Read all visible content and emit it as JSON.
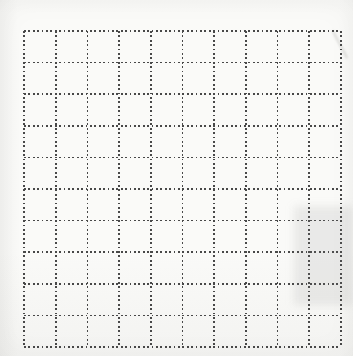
{
  "canvas": {
    "width_px": 353,
    "height_px": 356,
    "background_color": "#fafaf8"
  },
  "grid": {
    "rows": 10,
    "columns": 10,
    "left_px": 24,
    "top_px": 31,
    "right_px": 341,
    "bottom_px": 347,
    "line_style": "dotted",
    "dot_color": "#484848",
    "dot_size_px": 1.8,
    "dot_period_px": 4.4,
    "line_thickness_px": 1.8
  },
  "artifacts": {
    "shaded_patch": {
      "left_px": 294,
      "top_px": 206,
      "width_px": 59,
      "height_px": 99,
      "color": "rgba(125,125,120,0.13)",
      "blur_px": 4
    },
    "diagonal_smudge": {
      "center_x_px": 340,
      "center_y_px": 44,
      "length_px": 31,
      "width_px": 2,
      "rotation_deg": -28,
      "color": "rgba(110,110,105,0.22)",
      "blur_px": 1
    }
  }
}
